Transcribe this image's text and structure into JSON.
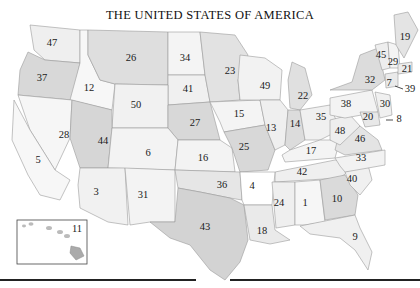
{
  "title": "THE UNITED STATES OF AMERICA",
  "colors": {
    "light": "#f3f3f3",
    "lighter": "#f7f7f7",
    "medium": "#e2e2e2",
    "dark": "#d0d0d0",
    "water": "#ffffff",
    "border": "#9a9a9a",
    "rule": "#222222"
  },
  "states": [
    {
      "label": "47",
      "x": 52,
      "y": 44,
      "fill": "#efefef",
      "points": "30,25 80,30 80,63 45,60 34,50"
    },
    {
      "label": "37",
      "x": 42,
      "y": 79,
      "fill": "#d8d8d8",
      "points": "28,52 45,60 80,63 72,100 18,95 20,70"
    },
    {
      "label": "12",
      "x": 89,
      "y": 89,
      "fill": "#f7f7f7",
      "points": "80,30 88,30 88,55 100,80 115,84 112,110 70,100 80,63"
    },
    {
      "label": "26",
      "x": 131,
      "y": 59,
      "fill": "#dedede",
      "points": "88,30 168,32 168,85 115,84 100,80 88,55"
    },
    {
      "label": "34",
      "x": 185,
      "y": 59,
      "fill": "#f4f4f4",
      "points": "168,32 200,32 205,75 168,75"
    },
    {
      "label": "41",
      "x": 188,
      "y": 90,
      "fill": "#f0f0f0",
      "points": "168,75 205,75 210,102 168,105"
    },
    {
      "label": "50",
      "x": 136,
      "y": 106,
      "fill": "#f1f1f1",
      "points": "115,84 168,85 168,128 112,128"
    },
    {
      "label": "27",
      "x": 195,
      "y": 124,
      "fill": "#d8d8d8",
      "points": "168,105 210,102 220,140 178,140 168,128"
    },
    {
      "label": "23",
      "x": 230,
      "y": 72,
      "fill": "#e2e2e2",
      "points": "200,32 235,35 248,55 238,80 240,100 210,102 205,75"
    },
    {
      "label": "15",
      "x": 239,
      "y": 115,
      "fill": "#f4f4f4",
      "points": "210,102 260,100 265,125 224,132 220,122"
    },
    {
      "label": "49",
      "x": 265,
      "y": 87,
      "fill": "#f2f2f2",
      "points": "240,55 265,58 282,70 280,100 260,100 240,100 238,80"
    },
    {
      "label": "22",
      "x": 303,
      "y": 97,
      "fill": "#e0e0e0",
      "points": "292,62 305,68 312,95 300,110 290,108 288,80"
    },
    {
      "label": "28",
      "x": 64,
      "y": 136,
      "fill": "#f6f6f6",
      "points": "18,95 72,100 70,138 55,170 30,130"
    },
    {
      "label": "5",
      "x": 38,
      "y": 161,
      "fill": "#f7f7f7",
      "points": "14,100 30,130 55,170 70,180 60,200 40,195 28,175 12,140"
    },
    {
      "label": "44",
      "x": 103,
      "y": 142,
      "fill": "#d6d6d6",
      "points": "72,100 112,110 112,128 108,168 80,168 70,138"
    },
    {
      "label": "6",
      "x": 148,
      "y": 154,
      "fill": "#f3f3f3",
      "points": "112,128 168,128 178,140 175,170 108,168"
    },
    {
      "label": "16",
      "x": 203,
      "y": 159,
      "fill": "#f3f3f3",
      "points": "178,140 220,140 232,148 235,172 175,170"
    },
    {
      "label": "25",
      "x": 244,
      "y": 148,
      "fill": "#d8d8d8",
      "points": "224,132 265,125 275,150 268,170 240,172 232,148"
    },
    {
      "label": "13",
      "x": 271,
      "y": 129,
      "fill": "#efefef",
      "points": "260,100 280,100 288,110 285,145 275,150 265,125"
    },
    {
      "label": "14",
      "x": 295,
      "y": 125,
      "fill": "#dcdcdc",
      "points": "288,110 300,110 305,140 290,150 285,145"
    },
    {
      "label": "35",
      "x": 321,
      "y": 118,
      "fill": "#f0f0f0",
      "points": "300,110 330,105 340,130 320,140 305,140"
    },
    {
      "label": "17",
      "x": 311,
      "y": 152,
      "fill": "#f4f4f4",
      "points": "290,150 320,140 340,140 335,158 285,162 282,155"
    },
    {
      "label": "42",
      "x": 302,
      "y": 173,
      "fill": "#efefef",
      "points": "275,172 335,160 360,162 340,178 275,182"
    },
    {
      "label": "3",
      "x": 96,
      "y": 193,
      "fill": "#f1f1f1",
      "points": "80,168 125,168 128,225 108,222 80,208 78,185"
    },
    {
      "label": "31",
      "x": 143,
      "y": 196,
      "fill": "#f3f3f3",
      "points": "125,168 175,170 175,222 150,222 130,225"
    },
    {
      "label": "36",
      "x": 222,
      "y": 186,
      "fill": "#e6e6e6",
      "points": "175,170 240,172 242,200 230,198 200,192 178,188"
    },
    {
      "label": "4",
      "x": 252,
      "y": 187,
      "fill": "#ffffff",
      "points": "240,172 275,172 272,205 244,205 242,200"
    },
    {
      "label": "43",
      "x": 205,
      "y": 228,
      "fill": "#d3d3d3",
      "points": "150,222 175,222 178,188 200,192 230,198 244,205 248,240 240,262 225,280 210,270 190,245 170,238"
    },
    {
      "label": "18",
      "x": 262,
      "y": 232,
      "fill": "#eaeaea",
      "points": "244,205 272,205 275,230 290,240 270,244 250,240"
    },
    {
      "label": "24",
      "x": 279,
      "y": 204,
      "fill": "#efefef",
      "points": "272,182 295,182 295,225 276,228"
    },
    {
      "label": "1",
      "x": 305,
      "y": 204,
      "fill": "#f6f6f6",
      "points": "295,182 320,180 325,222 305,225 295,225"
    },
    {
      "label": "10",
      "x": 337,
      "y": 200,
      "fill": "#dadada",
      "points": "320,180 345,175 358,195 355,215 325,220"
    },
    {
      "label": "9",
      "x": 355,
      "y": 238,
      "fill": "#f0f0f0",
      "points": "300,226 355,215 360,228 372,252 368,270 355,250 340,238 310,234"
    },
    {
      "label": "40",
      "x": 352,
      "y": 180,
      "fill": "#f0f0f0",
      "points": "345,172 368,165 372,180 360,195 350,185"
    },
    {
      "label": "33",
      "x": 361,
      "y": 159,
      "fill": "#f2f2f2",
      "points": "335,158 385,150 385,165 368,168 345,172 340,166"
    },
    {
      "label": "46",
      "x": 360,
      "y": 140,
      "fill": "#e4e4e4",
      "points": "340,130 360,126 378,140 382,150 345,155 335,150"
    },
    {
      "label": "48",
      "x": 340,
      "y": 132,
      "fill": "#eeeeee",
      "points": "330,120 350,115 360,126 340,145 330,140"
    },
    {
      "label": "38",
      "x": 346,
      "y": 105,
      "fill": "#f3f3f3",
      "points": "330,98 372,90 378,112 345,118 330,115"
    },
    {
      "label": "20",
      "x": 368,
      "y": 118,
      "fill": "#e8e8e8",
      "points": "360,112 378,112 380,125 365,127"
    },
    {
      "label": "30",
      "x": 385,
      "y": 105,
      "fill": "#f0f0f0",
      "points": "375,92 390,95 392,115 380,118"
    },
    {
      "label": "32",
      "x": 370,
      "y": 81,
      "fill": "#dcdcdc",
      "points": "330,90 352,82 360,55 378,48 385,80 372,90"
    },
    {
      "label": "45",
      "x": 381,
      "y": 56,
      "fill": "#eeeeee",
      "points": "375,45 388,42 390,68 382,70"
    },
    {
      "label": "29",
      "x": 393,
      "y": 63,
      "fill": "#f4f4f4",
      "points": "388,42 398,45 400,68 390,68"
    },
    {
      "label": "7",
      "x": 389,
      "y": 84,
      "fill": "#eaeaea",
      "points": "385,74 398,72 398,86 386,88"
    },
    {
      "label": "21",
      "x": 407,
      "y": 70,
      "fill": "#ececec",
      "points": "398,64 412,62 412,72 398,74"
    },
    {
      "label": "19",
      "x": 405,
      "y": 38,
      "fill": "#e4e4e4",
      "points": "394,15 408,12 418,30 404,58 396,45"
    }
  ],
  "callouts": [
    {
      "label": "39",
      "line": [
        395,
        86,
        403,
        89
      ],
      "x": 410,
      "y": 90
    },
    {
      "label": "8",
      "line": [
        386,
        120,
        393,
        120
      ],
      "x": 399,
      "y": 120
    }
  ],
  "inset": {
    "label": "11",
    "box": {
      "x": 17,
      "y": 220,
      "w": 70,
      "h": 44
    },
    "label_pos": {
      "x": 77,
      "y": 230
    }
  }
}
